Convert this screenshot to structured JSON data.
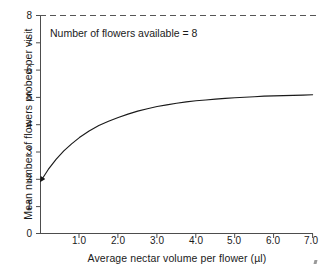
{
  "chart_data": {
    "type": "line",
    "title": "",
    "xlabel": "Average nectar volume per flower (µl)",
    "ylabel": "Mean number of flowers probed per visit",
    "xlim": [
      0,
      7.2
    ],
    "ylim": [
      0,
      8
    ],
    "grid": false,
    "legend": null,
    "xticks": [
      "1.0",
      "2.0",
      "3.0",
      "4.0",
      "5.0",
      "6.0",
      "7.0"
    ],
    "xtick_values": [
      1.0,
      2.0,
      3.0,
      4.0,
      5.0,
      6.0,
      7.0
    ],
    "yticks": [
      "0",
      "1",
      "2",
      "3",
      "4",
      "5",
      "6",
      "7",
      "8"
    ],
    "ytick_values": [
      0,
      1,
      2,
      3,
      4,
      5,
      6,
      7,
      8
    ],
    "annotations": [
      {
        "text": "Number of flowers available = 8",
        "x": 0.35,
        "y": 7.3
      }
    ],
    "reference_lines": [
      {
        "name": "flowers-available",
        "orientation": "horizontal",
        "y": 8,
        "style": "dashed",
        "color": "#555555"
      }
    ],
    "series": [
      {
        "name": "mean flowers probed per visit",
        "style": "solid",
        "color": "#1a1a1a",
        "start_marker": "arrowhead",
        "x": [
          0.05,
          0.2,
          0.4,
          0.6,
          0.8,
          1.0,
          1.25,
          1.5,
          1.75,
          2.0,
          2.25,
          2.5,
          2.75,
          3.0,
          3.25,
          3.5,
          3.75,
          4.0,
          4.25,
          4.5,
          4.75,
          5.0,
          5.25,
          5.5,
          5.75,
          6.0,
          6.25,
          6.5,
          6.75,
          7.0
        ],
        "values": [
          2.02,
          2.35,
          2.72,
          3.03,
          3.29,
          3.52,
          3.76,
          3.96,
          4.12,
          4.26,
          4.38,
          4.49,
          4.58,
          4.66,
          4.72,
          4.78,
          4.83,
          4.87,
          4.9,
          4.93,
          4.96,
          4.98,
          5.0,
          5.02,
          5.04,
          5.05,
          5.06,
          5.07,
          5.08,
          5.09
        ]
      }
    ]
  },
  "colors": {
    "axis": "#4d4d4d",
    "curve": "#1a1a1a",
    "dashed": "#555555",
    "text": "#1a1a1a",
    "background": "#ffffff"
  }
}
